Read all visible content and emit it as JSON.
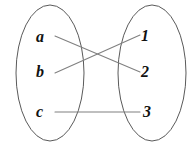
{
  "figure": {
    "type": "set-mapping-diagram",
    "width": 196,
    "height": 147,
    "background_color": "#ffffff",
    "line_color": "#808080",
    "ellipse_stroke_color": "#5a5a5a",
    "label_color": "#111111"
  },
  "sets": {
    "domain": {
      "name": "left-set",
      "ellipse": {
        "cx": 50,
        "cy": 73,
        "rx": 34,
        "ry": 68
      },
      "elements": [
        {
          "label": "a",
          "x": 43,
          "y": 37
        },
        {
          "label": "b",
          "x": 43,
          "y": 72
        },
        {
          "label": "c",
          "x": 43,
          "y": 112
        }
      ]
    },
    "codomain": {
      "name": "right-set",
      "ellipse": {
        "cx": 152,
        "cy": 73,
        "rx": 34,
        "ry": 68
      },
      "elements": [
        {
          "label": "1",
          "x": 148,
          "y": 36
        },
        {
          "label": "2",
          "x": 148,
          "y": 72
        },
        {
          "label": "3",
          "x": 112,
          "y": 112
        }
      ]
    }
  },
  "edges": [
    {
      "name": "edge-a-to-2",
      "from": "a",
      "to": "2",
      "x1": 55,
      "y1": 36,
      "x2": 140,
      "y2": 72
    },
    {
      "name": "edge-b-to-1",
      "from": "b",
      "to": "1",
      "x1": 55,
      "y1": 73,
      "x2": 140,
      "y2": 35
    },
    {
      "name": "edge-c-to-3",
      "from": "c",
      "to": "3",
      "x1": 55,
      "y1": 112,
      "x2": 140,
      "y2": 112
    }
  ]
}
